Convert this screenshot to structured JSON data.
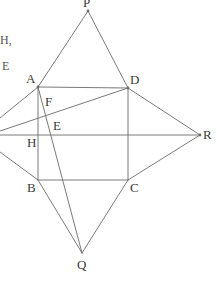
{
  "figure": {
    "width": 217,
    "height": 287,
    "background": "#ffffff",
    "stroke_color": "#6b6b6b",
    "stroke_width": 0.9,
    "label_color": "#3b3b3b"
  },
  "margin_text": {
    "line1": "H,",
    "line2": "E"
  },
  "vertices": [
    {
      "name": "P",
      "label": "P",
      "x": 88,
      "y": 11,
      "label_x": 83,
      "label_y": -4
    },
    {
      "name": "A",
      "label": "A",
      "x": 38,
      "y": 87,
      "label_x": 26,
      "label_y": 72
    },
    {
      "name": "D",
      "label": "D",
      "x": 128,
      "y": 88,
      "label_x": 130,
      "label_y": 73
    },
    {
      "name": "F",
      "label": "F",
      "x": 43,
      "y": 104,
      "label_x": 45,
      "label_y": 95
    },
    {
      "name": "E",
      "label": "E",
      "x": 50,
      "y": 128,
      "label_x": 53,
      "label_y": 119
    },
    {
      "name": "H",
      "label": "H",
      "x": 38,
      "y": 135,
      "label_x": 27,
      "label_y": 136
    },
    {
      "name": "R",
      "label": "R",
      "x": 200,
      "y": 135,
      "label_x": 203,
      "label_y": 128
    },
    {
      "name": "B",
      "label": "B",
      "x": 38,
      "y": 180,
      "label_x": 27,
      "label_y": 181
    },
    {
      "name": "C",
      "label": "C",
      "x": 128,
      "y": 180,
      "label_x": 130,
      "label_y": 181
    },
    {
      "name": "Q",
      "label": "Q",
      "x": 82,
      "y": 253,
      "label_x": 77,
      "label_y": 258
    }
  ],
  "segments": [
    {
      "name": "square-side-AD",
      "x1": 38,
      "y1": 87,
      "x2": 128,
      "y2": 88
    },
    {
      "name": "square-side-DC",
      "x1": 128,
      "y1": 88,
      "x2": 128,
      "y2": 180
    },
    {
      "name": "square-side-CB",
      "x1": 128,
      "y1": 180,
      "x2": 38,
      "y2": 180
    },
    {
      "name": "square-side-BA",
      "x1": 38,
      "y1": 180,
      "x2": 38,
      "y2": 87
    },
    {
      "name": "apex-P-to-A",
      "x1": 88,
      "y1": 11,
      "x2": 38,
      "y2": 87
    },
    {
      "name": "apex-P-to-D",
      "x1": 88,
      "y1": 11,
      "x2": 128,
      "y2": 88
    },
    {
      "name": "apex-Q-to-B",
      "x1": 82,
      "y1": 253,
      "x2": 38,
      "y2": 180
    },
    {
      "name": "apex-Q-to-C",
      "x1": 82,
      "y1": 253,
      "x2": 128,
      "y2": 180
    },
    {
      "name": "apex-R-to-D",
      "x1": 200,
      "y1": 135,
      "x2": 128,
      "y2": 88
    },
    {
      "name": "apex-R-to-C",
      "x1": 200,
      "y1": 135,
      "x2": 128,
      "y2": 180
    },
    {
      "name": "left-apex-to-A",
      "x1": 0,
      "y1": 118,
      "x2": 38,
      "y2": 87
    },
    {
      "name": "left-apex-to-B",
      "x1": 0,
      "y1": 152,
      "x2": 38,
      "y2": 180
    },
    {
      "name": "horizontal-axis-H-to-R",
      "x1": 0,
      "y1": 135,
      "x2": 200,
      "y2": 135
    },
    {
      "name": "cevian-left-edge-to-D",
      "x1": 0,
      "y1": 131,
      "x2": 128,
      "y2": 88
    },
    {
      "name": "cevian-A-to-Q",
      "x1": 38,
      "y1": 87,
      "x2": 82,
      "y2": 253
    }
  ]
}
